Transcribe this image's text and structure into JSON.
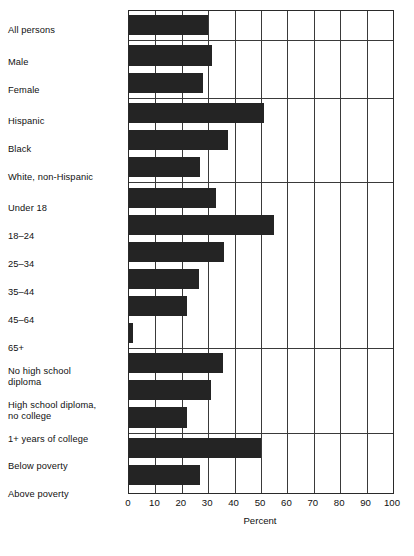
{
  "chart_data": {
    "type": "bar",
    "orientation": "horizontal",
    "title": "",
    "xlabel": "Percent",
    "ylabel": "",
    "xlim": [
      0,
      100
    ],
    "xticks": [
      0,
      10,
      20,
      30,
      40,
      50,
      60,
      70,
      80,
      90,
      100
    ],
    "grid": "vertical",
    "legend": "none",
    "bar_color": "#242424",
    "categories": [
      "All persons",
      "Male",
      "Female",
      "Hispanic",
      "Black",
      "White, non-Hispanic",
      "Under 18",
      "18–24",
      "25–34",
      "35–44",
      "45–64",
      "65+",
      "No high school\ndiploma",
      "High school diploma,\nno college",
      "1+ years of college",
      "Below poverty",
      "Above poverty"
    ],
    "values": [
      30,
      31.5,
      28,
      51,
      37.5,
      27,
      33,
      55,
      36,
      26.5,
      22,
      1.5,
      35.5,
      31,
      22,
      50,
      27
    ],
    "groups": [
      {
        "name": "total",
        "indices": [
          0
        ]
      },
      {
        "name": "sex",
        "indices": [
          1,
          2
        ]
      },
      {
        "name": "race-ethnicity",
        "indices": [
          3,
          4,
          5
        ]
      },
      {
        "name": "age",
        "indices": [
          6,
          7,
          8,
          9,
          10,
          11
        ]
      },
      {
        "name": "education",
        "indices": [
          12,
          13,
          14
        ]
      },
      {
        "name": "poverty",
        "indices": [
          15,
          16
        ]
      }
    ]
  },
  "axis": {
    "tick_labels": [
      "0",
      "10",
      "20",
      "30",
      "40",
      "50",
      "60",
      "70",
      "80",
      "90",
      "100"
    ],
    "title": "Percent"
  }
}
